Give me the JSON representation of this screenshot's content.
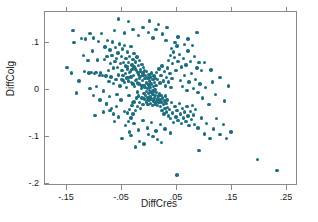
{
  "chart_data": {
    "type": "scatter",
    "title": "",
    "xlabel": "DiffCres",
    "ylabel": "DiffColg",
    "xlim": [
      -0.19,
      0.27
    ],
    "ylim": [
      -0.205,
      0.165
    ],
    "grid": false,
    "legend": "none",
    "marker_color": "#1d6e80",
    "frame_color": "#8a8a8a",
    "xticks": [
      -0.15,
      -0.05,
      0.05,
      0.15,
      0.25
    ],
    "xticklabels": [
      "-.15",
      "-.05",
      ".05",
      ".15",
      ".25"
    ],
    "yticks": [
      0.1,
      0.0,
      -0.1,
      -0.2
    ],
    "yticklabels": [
      ".1",
      "0",
      "-.1",
      "-.2"
    ],
    "n_points": 303,
    "points": [
      [
        -0.15,
        0.047
      ],
      [
        -0.142,
        0.035
      ],
      [
        -0.139,
        0.126
      ],
      [
        -0.137,
        0.1
      ],
      [
        -0.133,
        -0.007
      ],
      [
        -0.128,
        0.018
      ],
      [
        -0.124,
        0.109
      ],
      [
        -0.12,
        0.073
      ],
      [
        -0.118,
        0.038
      ],
      [
        -0.116,
        0.108
      ],
      [
        -0.112,
        0.062
      ],
      [
        -0.11,
        0.035
      ],
      [
        -0.108,
        0.119
      ],
      [
        -0.106,
        0.036
      ],
      [
        -0.104,
        0.082
      ],
      [
        -0.102,
        0.11
      ],
      [
        -0.1,
        0.034
      ],
      [
        -0.099,
        -0.055
      ],
      [
        -0.097,
        0.037
      ],
      [
        -0.095,
        0.063
      ],
      [
        -0.093,
        0.102
      ],
      [
        -0.091,
        0.03
      ],
      [
        -0.089,
        0.035
      ],
      [
        -0.087,
        0.119
      ],
      [
        -0.086,
        0.03
      ],
      [
        -0.084,
        -0.003
      ],
      [
        -0.082,
        0.064
      ],
      [
        -0.081,
        0.091
      ],
      [
        -0.079,
        0.029
      ],
      [
        -0.078,
        -0.031
      ],
      [
        -0.077,
        0.07
      ],
      [
        -0.076,
        0.105
      ],
      [
        -0.075,
        0.04
      ],
      [
        -0.074,
        0.017
      ],
      [
        -0.073,
        -0.015
      ],
      [
        -0.072,
        0.084
      ],
      [
        -0.071,
        0.056
      ],
      [
        -0.07,
        0.027
      ],
      [
        -0.069,
        -0.04
      ],
      [
        -0.068,
        0.072
      ],
      [
        -0.067,
        0.101
      ],
      [
        -0.066,
        0.013
      ],
      [
        -0.065,
        0.046
      ],
      [
        -0.064,
        -0.068
      ],
      [
        -0.063,
        0.06
      ],
      [
        -0.062,
        0.089
      ],
      [
        -0.061,
        0.022
      ],
      [
        -0.06,
        0.066
      ],
      [
        -0.059,
        -0.01
      ],
      [
        -0.058,
        0.047
      ],
      [
        -0.057,
        0.078
      ],
      [
        -0.056,
        0.031
      ],
      [
        -0.055,
        0.097
      ],
      [
        -0.054,
        0.008
      ],
      [
        -0.053,
        0.055
      ],
      [
        -0.052,
        -0.022
      ],
      [
        -0.051,
        0.07
      ],
      [
        -0.05,
        0.041
      ],
      [
        -0.049,
        0.086
      ],
      [
        -0.048,
        0.019
      ],
      [
        -0.047,
        0.058
      ],
      [
        -0.046,
        -0.046
      ],
      [
        -0.045,
        0.094
      ],
      [
        -0.044,
        0.034
      ],
      [
        -0.043,
        0.066
      ],
      [
        -0.042,
        0.004
      ],
      [
        -0.041,
        0.049
      ],
      [
        -0.04,
        0.08
      ],
      [
        -0.039,
        0.026
      ],
      [
        -0.038,
        0.058
      ],
      [
        -0.037,
        -0.012
      ],
      [
        -0.036,
        0.071
      ],
      [
        -0.035,
        0.039
      ],
      [
        -0.034,
        0.092
      ],
      [
        -0.033,
        0.015
      ],
      [
        -0.032,
        0.052
      ],
      [
        -0.031,
        -0.028
      ],
      [
        -0.03,
        0.064
      ],
      [
        -0.029,
        0.03
      ],
      [
        -0.028,
        0.077
      ],
      [
        -0.027,
        0.006
      ],
      [
        -0.026,
        0.044
      ],
      [
        -0.025,
        0.059
      ],
      [
        -0.024,
        0.021
      ],
      [
        -0.023,
        0.069
      ],
      [
        -0.022,
        -0.005
      ],
      [
        -0.021,
        0.037
      ],
      [
        -0.02,
        0.051
      ],
      [
        -0.019,
        0.012
      ],
      [
        -0.018,
        0.062
      ],
      [
        -0.017,
        0.028
      ],
      [
        -0.016,
        0.043
      ],
      [
        -0.015,
        0.002
      ],
      [
        -0.014,
        0.054
      ],
      [
        -0.013,
        0.019
      ],
      [
        -0.012,
        0.035
      ],
      [
        -0.011,
        0.047
      ],
      [
        -0.01,
        0.009
      ],
      [
        -0.009,
        0.04
      ],
      [
        -0.008,
        0.024
      ],
      [
        -0.048,
        0.03
      ],
      [
        -0.044,
        0.05
      ],
      [
        -0.04,
        0.044
      ],
      [
        -0.036,
        0.036
      ],
      [
        -0.032,
        0.043
      ],
      [
        -0.028,
        0.048
      ],
      [
        -0.024,
        0.04
      ],
      [
        -0.02,
        0.033
      ],
      [
        -0.016,
        0.038
      ],
      [
        -0.012,
        0.03
      ],
      [
        -0.05,
        0.022
      ],
      [
        -0.046,
        0.015
      ],
      [
        -0.042,
        0.025
      ],
      [
        -0.038,
        0.018
      ],
      [
        -0.034,
        0.027
      ],
      [
        -0.03,
        0.012
      ],
      [
        -0.026,
        0.02
      ],
      [
        -0.022,
        0.014
      ],
      [
        -0.018,
        0.023
      ],
      [
        -0.014,
        0.008
      ],
      [
        -0.007,
        0.03
      ],
      [
        -0.006,
        0.014
      ],
      [
        -0.005,
        0.038
      ],
      [
        -0.004,
        0.002
      ],
      [
        -0.003,
        0.025
      ],
      [
        -0.002,
        0.01
      ],
      [
        -0.001,
        0.032
      ],
      [
        0.0,
        0.018
      ],
      [
        0.001,
        0.004
      ],
      [
        0.002,
        0.027
      ],
      [
        0.003,
        0.012
      ],
      [
        0.004,
        0.035
      ],
      [
        0.005,
        -0.002
      ],
      [
        0.006,
        0.021
      ],
      [
        0.007,
        0.007
      ],
      [
        0.008,
        0.029
      ],
      [
        0.009,
        0.015
      ],
      [
        0.01,
        0.0
      ],
      [
        0.011,
        0.023
      ],
      [
        0.012,
        0.009
      ],
      [
        -0.01,
        -0.008
      ],
      [
        -0.009,
        -0.02
      ],
      [
        -0.008,
        0.004
      ],
      [
        -0.007,
        -0.012
      ],
      [
        -0.006,
        -0.026
      ],
      [
        -0.005,
        -0.004
      ],
      [
        -0.004,
        -0.018
      ],
      [
        -0.003,
        -0.032
      ],
      [
        -0.002,
        -0.008
      ],
      [
        -0.001,
        -0.022
      ],
      [
        0.0,
        -0.002
      ],
      [
        0.001,
        -0.016
      ],
      [
        0.002,
        -0.03
      ],
      [
        0.003,
        -0.006
      ],
      [
        0.004,
        -0.02
      ],
      [
        0.005,
        -0.034
      ],
      [
        0.006,
        -0.01
      ],
      [
        0.007,
        -0.024
      ],
      [
        0.008,
        -0.004
      ],
      [
        0.009,
        -0.018
      ],
      [
        0.01,
        -0.032
      ],
      [
        0.011,
        -0.012
      ],
      [
        0.012,
        -0.026
      ],
      [
        0.013,
        -0.006
      ],
      [
        0.014,
        -0.02
      ],
      [
        0.015,
        -0.034
      ],
      [
        0.016,
        -0.014
      ],
      [
        0.017,
        -0.028
      ],
      [
        0.018,
        -0.008
      ],
      [
        0.019,
        -0.022
      ],
      [
        -0.02,
        -0.014
      ],
      [
        -0.018,
        -0.028
      ],
      [
        -0.016,
        -0.04
      ],
      [
        -0.014,
        -0.018
      ],
      [
        -0.012,
        -0.032
      ],
      [
        -0.022,
        -0.036
      ],
      [
        -0.024,
        -0.018
      ],
      [
        -0.026,
        -0.044
      ],
      [
        -0.028,
        -0.026
      ],
      [
        -0.03,
        -0.052
      ],
      [
        -0.032,
        -0.034
      ],
      [
        -0.034,
        -0.06
      ],
      [
        -0.036,
        -0.042
      ],
      [
        -0.038,
        -0.068
      ],
      [
        -0.04,
        -0.05
      ],
      [
        0.02,
        -0.036
      ],
      [
        0.021,
        -0.012
      ],
      [
        0.022,
        -0.026
      ],
      [
        0.023,
        -0.044
      ],
      [
        0.024,
        -0.018
      ],
      [
        0.025,
        -0.032
      ],
      [
        0.026,
        -0.052
      ],
      [
        0.027,
        -0.024
      ],
      [
        0.028,
        -0.04
      ],
      [
        0.029,
        -0.014
      ],
      [
        0.03,
        -0.03
      ],
      [
        0.031,
        -0.048
      ],
      [
        0.032,
        -0.022
      ],
      [
        0.033,
        -0.038
      ],
      [
        0.034,
        -0.056
      ],
      [
        0.013,
        0.036
      ],
      [
        0.015,
        0.022
      ],
      [
        0.017,
        0.044
      ],
      [
        0.019,
        0.014
      ],
      [
        0.021,
        0.03
      ],
      [
        0.023,
        0.05
      ],
      [
        0.025,
        0.018
      ],
      [
        0.027,
        0.038
      ],
      [
        0.029,
        0.008
      ],
      [
        0.031,
        0.026
      ],
      [
        0.033,
        0.046
      ],
      [
        0.035,
        0.016
      ],
      [
        0.037,
        0.034
      ],
      [
        0.039,
        0.004
      ],
      [
        0.041,
        0.024
      ],
      [
        0.035,
        0.062
      ],
      [
        0.038,
        0.072
      ],
      [
        0.042,
        0.055
      ],
      [
        0.045,
        0.068
      ],
      [
        0.048,
        0.04
      ],
      [
        0.04,
        0.088
      ],
      [
        0.044,
        0.08
      ],
      [
        0.05,
        0.093
      ],
      [
        0.052,
        0.06
      ],
      [
        0.055,
        0.074
      ],
      [
        0.036,
        -0.042
      ],
      [
        0.038,
        -0.062
      ],
      [
        0.04,
        -0.028
      ],
      [
        0.042,
        -0.05
      ],
      [
        0.044,
        -0.07
      ],
      [
        0.046,
        -0.036
      ],
      [
        0.048,
        -0.058
      ],
      [
        0.05,
        -0.044
      ],
      [
        0.052,
        -0.066
      ],
      [
        0.054,
        -0.03
      ],
      [
        0.056,
        -0.052
      ],
      [
        0.058,
        -0.072
      ],
      [
        0.06,
        -0.04
      ],
      [
        0.062,
        -0.06
      ],
      [
        0.064,
        -0.048
      ],
      [
        0.066,
        -0.068
      ],
      [
        0.068,
        -0.036
      ],
      [
        0.07,
        -0.056
      ],
      [
        0.072,
        -0.076
      ],
      [
        0.074,
        -0.046
      ],
      [
        0.076,
        -0.064
      ],
      [
        0.078,
        -0.034
      ],
      [
        0.08,
        -0.054
      ],
      [
        0.082,
        -0.074
      ],
      [
        0.084,
        -0.042
      ],
      [
        0.056,
        0.02
      ],
      [
        0.06,
        0.006
      ],
      [
        0.064,
        0.03
      ],
      [
        0.068,
        -0.002
      ],
      [
        0.072,
        0.016
      ],
      [
        0.076,
        0.034
      ],
      [
        0.08,
        0.002
      ],
      [
        0.084,
        0.022
      ],
      [
        0.088,
        -0.006
      ],
      [
        0.092,
        0.012
      ],
      [
        0.058,
        0.048
      ],
      [
        0.062,
        0.066
      ],
      [
        0.066,
        0.052
      ],
      [
        0.07,
        0.082
      ],
      [
        0.074,
        0.06
      ],
      [
        0.078,
        0.094
      ],
      [
        0.082,
        0.07
      ],
      [
        0.086,
        0.046
      ],
      [
        0.09,
        0.058
      ],
      [
        0.094,
        0.04
      ],
      [
        0.086,
        0.122
      ],
      [
        0.07,
        0.108
      ],
      [
        0.064,
        0.096
      ],
      [
        0.052,
        0.112
      ],
      [
        0.046,
        0.1
      ],
      [
        0.03,
        0.104
      ],
      [
        0.024,
        0.118
      ],
      [
        0.012,
        0.128
      ],
      [
        0.006,
        0.11
      ],
      [
        -0.002,
        0.122
      ],
      [
        -0.012,
        0.132
      ],
      [
        -0.02,
        0.115
      ],
      [
        -0.03,
        0.128
      ],
      [
        -0.038,
        0.145
      ],
      [
        -0.046,
        0.12
      ],
      [
        -0.056,
        0.15
      ],
      [
        -0.064,
        0.126
      ],
      [
        0.0,
        0.146
      ],
      [
        0.016,
        0.138
      ],
      [
        0.032,
        0.132
      ],
      [
        -0.044,
        -0.076
      ],
      [
        -0.036,
        -0.09
      ],
      [
        -0.028,
        -0.072
      ],
      [
        -0.02,
        -0.086
      ],
      [
        -0.012,
        -0.066
      ],
      [
        -0.004,
        -0.082
      ],
      [
        0.004,
        -0.07
      ],
      [
        0.012,
        -0.088
      ],
      [
        0.02,
        -0.074
      ],
      [
        0.028,
        -0.084
      ],
      [
        -0.05,
        -0.104
      ],
      [
        -0.034,
        -0.098
      ],
      [
        -0.018,
        -0.11
      ],
      [
        -0.002,
        -0.096
      ],
      [
        0.014,
        -0.106
      ],
      [
        -0.026,
        -0.122
      ],
      [
        -0.01,
        -0.116
      ],
      [
        0.006,
        -0.1
      ],
      [
        0.022,
        -0.112
      ],
      [
        0.038,
        -0.092
      ],
      [
        0.088,
        -0.082
      ],
      [
        0.094,
        -0.06
      ],
      [
        0.1,
        -0.094
      ],
      [
        0.104,
        -0.072
      ],
      [
        0.11,
        -0.104
      ],
      [
        0.116,
        -0.084
      ],
      [
        0.122,
        -0.062
      ],
      [
        0.128,
        -0.096
      ],
      [
        0.134,
        -0.074
      ],
      [
        0.14,
        -0.104
      ],
      [
        0.096,
        -0.018
      ],
      [
        0.102,
        0.004
      ],
      [
        0.108,
        -0.032
      ],
      [
        0.114,
        0.016
      ],
      [
        0.12,
        -0.01
      ],
      [
        0.128,
        0.026
      ],
      [
        0.136,
        -0.024
      ],
      [
        0.144,
        0.008
      ],
      [
        0.1,
        0.058
      ],
      [
        0.112,
        0.042
      ],
      [
        0.09,
        -0.13
      ],
      [
        0.05,
        -0.182
      ],
      [
        0.232,
        -0.172
      ],
      [
        0.196,
        -0.148
      ],
      [
        0.148,
        -0.09
      ],
      [
        -0.056,
        -0.058
      ],
      [
        -0.06,
        -0.036
      ],
      [
        -0.066,
        -0.052
      ],
      [
        -0.072,
        -0.044
      ],
      [
        -0.078,
        -0.03
      ],
      [
        -0.084,
        -0.048
      ],
      [
        -0.09,
        -0.022
      ],
      [
        -0.096,
        0.006
      ],
      [
        -0.102,
        -0.012
      ],
      [
        -0.108,
        0.002
      ]
    ]
  }
}
